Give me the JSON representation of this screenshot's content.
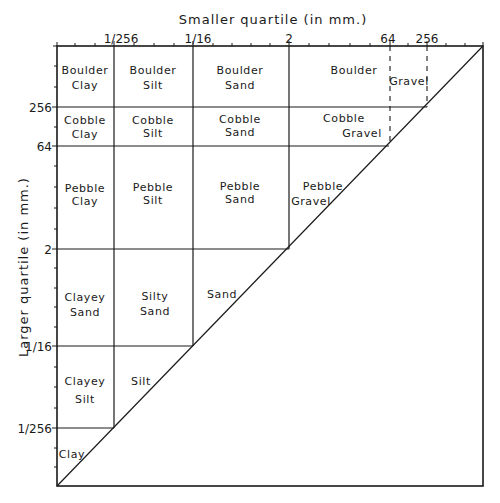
{
  "diagram": {
    "x_axis_title": "Smaller quartile (in mm.)",
    "y_axis_title": "Larger quartile (in mm.)",
    "x_ticks": [
      {
        "label": "1/256",
        "log2": -8
      },
      {
        "label": "1/16",
        "log2": -4
      },
      {
        "label": "2",
        "log2": 1
      },
      {
        "label": "64",
        "log2": 6
      },
      {
        "label": "256",
        "log2": 8
      }
    ],
    "y_ticks": [
      {
        "label": "256",
        "log2": 8
      },
      {
        "label": "64",
        "log2": 6
      },
      {
        "label": "2",
        "log2": 1
      },
      {
        "label": "1/16",
        "log2": -4
      },
      {
        "label": "1/256",
        "log2": -8
      }
    ],
    "cells": {
      "boulder_clay": [
        "Boulder",
        "Clay"
      ],
      "boulder_silt": [
        "Boulder",
        "Silt"
      ],
      "boulder_sand": [
        "Boulder",
        "Sand"
      ],
      "boulder": [
        "Boulder"
      ],
      "gravel": [
        "Gravel"
      ],
      "cobble_clay": [
        "Cobble",
        "Clay"
      ],
      "cobble_silt": [
        "Cobble",
        "Silt"
      ],
      "cobble_sand": [
        "Cobble",
        "Sand"
      ],
      "cobble_gravel": [
        "Cobble",
        "Gravel"
      ],
      "pebble_clay": [
        "Pebble",
        "Clay"
      ],
      "pebble_silt": [
        "Pebble",
        "Silt"
      ],
      "pebble_sand": [
        "Pebble",
        "Sand"
      ],
      "pebble_gravel": [
        "Pebble",
        "Gravel"
      ],
      "clayey_sand": [
        "Clayey",
        "Sand"
      ],
      "silty_sand": [
        "Silty",
        "Sand"
      ],
      "sand": [
        "Sand"
      ],
      "clayey_silt": [
        "Clayey",
        "Silt"
      ],
      "silt": [
        "Silt"
      ],
      "clay": [
        "Clay"
      ]
    }
  }
}
